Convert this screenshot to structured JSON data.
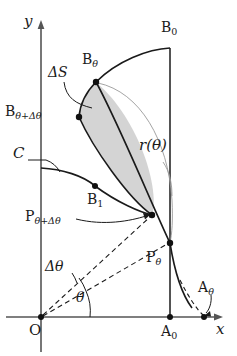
{
  "figure": {
    "type": "geometry-diagram",
    "background_color": "#ffffff",
    "stroke_color": "#1a1a1a",
    "shade_color": "#d0d0d0",
    "thin_color": "#8a8a8a"
  },
  "axes": {
    "x_label": "x",
    "y_label": "y",
    "origin_label": "O",
    "x_axis_y": 317,
    "y_axis_x": 41
  },
  "labels": {
    "B0": {
      "base": "B",
      "sub": "0"
    },
    "Btheta": {
      "base": "B",
      "sub": "θ"
    },
    "BthetaPlus": {
      "base": "B",
      "sub": "θ+Δθ"
    },
    "B1": {
      "base": "B",
      "sub": "1"
    },
    "Ptheta": {
      "base": "P",
      "sub": "θ"
    },
    "PthetaPlus": {
      "base": "P",
      "sub": "θ+Δθ"
    },
    "A0": {
      "base": "A",
      "sub": "0"
    },
    "Atheta": {
      "base": "A",
      "sub": "θ"
    },
    "C": "C",
    "deltaS": "ΔS",
    "r_theta": "r(θ)",
    "theta": "θ",
    "delta_theta": "Δθ"
  },
  "points": {
    "O": {
      "x": 41,
      "y": 317
    },
    "A0": {
      "x": 170,
      "y": 317
    },
    "Atheta": {
      "x": 205,
      "y": 317
    },
    "B0": {
      "x": 170,
      "y": 48
    },
    "Btheta": {
      "x": 96,
      "y": 82
    },
    "BthetaPlus": {
      "x": 79,
      "y": 117
    },
    "B1": {
      "x": 95,
      "y": 186
    },
    "Ptheta": {
      "x": 170,
      "y": 243
    },
    "PthetaPlus": {
      "x": 152,
      "y": 215
    }
  },
  "angles": {
    "theta_deg_from_x": 24,
    "delta_theta_deg": 13
  }
}
